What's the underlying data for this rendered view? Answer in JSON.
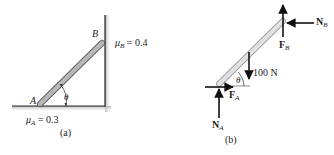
{
  "panel_a": {
    "caption": "(a)",
    "point_a": "A",
    "point_b": "B",
    "angle": "θ",
    "mu_a_symbol": "μ",
    "mu_a_sub": "A",
    "mu_a_value": " = 0.3",
    "mu_b_symbol": "μ",
    "mu_b_sub": "B",
    "mu_b_value": " = 0.4"
  },
  "panel_b": {
    "caption": "(b)",
    "angle": "θ",
    "weight": "100 N",
    "na_main": "N",
    "na_sub": "A",
    "fa_main": "F",
    "fa_sub": "A",
    "nb_main": "N",
    "nb_sub": "B",
    "fb_main": "F",
    "fb_sub": "B"
  },
  "colors": {
    "bar_fill": "#b8b8b8",
    "bar_fill_light": "#dedede",
    "line": "#222222",
    "shadow": "#c8c8c8"
  }
}
